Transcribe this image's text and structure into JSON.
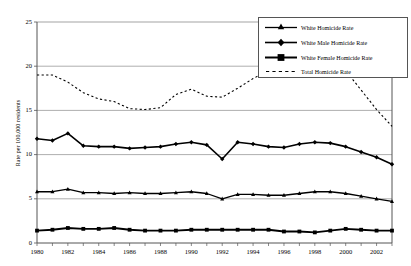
{
  "chart_data": {
    "type": "line",
    "title": "",
    "xlabel": "",
    "ylabel": "Rate per 100,000 residents",
    "ylim": [
      0,
      25
    ],
    "yticks": [
      0,
      5,
      10,
      15,
      20,
      25
    ],
    "xlim": [
      1980,
      2003
    ],
    "x": [
      1980,
      1981,
      1982,
      1983,
      1984,
      1985,
      1986,
      1987,
      1988,
      1989,
      1990,
      1991,
      1992,
      1993,
      1994,
      1995,
      1996,
      1997,
      1998,
      1999,
      2000,
      2001,
      2002,
      2003
    ],
    "xticks": [
      1980,
      1982,
      1984,
      1986,
      1988,
      1990,
      1992,
      1994,
      1996,
      1998,
      2000,
      2002
    ],
    "xtick_labels": [
      "1980",
      "1982",
      "1984",
      "1986",
      "1988",
      "1990",
      "1992",
      "1994",
      "1996",
      "1998",
      "2000",
      "2002"
    ],
    "grid": "horizontal",
    "legend_position": "top-right",
    "series": [
      {
        "name": "White Homicide Rate",
        "style": "solid-marker-triangle",
        "values": [
          5.8,
          5.8,
          6.1,
          5.7,
          5.7,
          5.6,
          5.7,
          5.6,
          5.6,
          5.7,
          5.8,
          5.6,
          5.0,
          5.5,
          5.5,
          5.4,
          5.4,
          5.6,
          5.8,
          5.8,
          5.6,
          5.3,
          5.0,
          4.7
        ]
      },
      {
        "name": "White Male Homicide Rate",
        "style": "solid-marker-diamond",
        "values": [
          11.8,
          11.6,
          12.4,
          11.0,
          10.9,
          10.9,
          10.7,
          10.8,
          10.9,
          11.2,
          11.4,
          11.1,
          9.5,
          11.4,
          11.2,
          10.9,
          10.8,
          11.2,
          11.4,
          11.3,
          10.9,
          10.3,
          9.7,
          8.9
        ]
      },
      {
        "name": "White Female Homicide Rate",
        "style": "solid-marker-square",
        "values": [
          1.4,
          1.5,
          1.7,
          1.6,
          1.6,
          1.7,
          1.5,
          1.4,
          1.4,
          1.4,
          1.5,
          1.5,
          1.5,
          1.5,
          1.5,
          1.5,
          1.3,
          1.3,
          1.2,
          1.4,
          1.6,
          1.5,
          1.4,
          1.4
        ]
      },
      {
        "name": "Total Homicide Rate",
        "style": "dashed",
        "values": [
          19.0,
          19.0,
          18.2,
          17.0,
          16.3,
          16.0,
          15.2,
          15.1,
          15.3,
          16.8,
          17.4,
          16.6,
          16.5,
          17.5,
          18.6,
          19.5,
          20.6,
          22.3,
          22.0,
          21.1,
          19.5,
          17.3,
          15.1,
          13.2
        ]
      }
    ]
  },
  "legend": {
    "entries": [
      {
        "label": "White Homicide Rate"
      },
      {
        "label": "White Male Homicide Rate"
      },
      {
        "label": "White Female Homicide Rate"
      },
      {
        "label": "Total Homicide Rate"
      }
    ]
  },
  "colors": {
    "line": "#000000",
    "grid": "#999999",
    "axis": "#555555",
    "background": "#ffffff"
  }
}
